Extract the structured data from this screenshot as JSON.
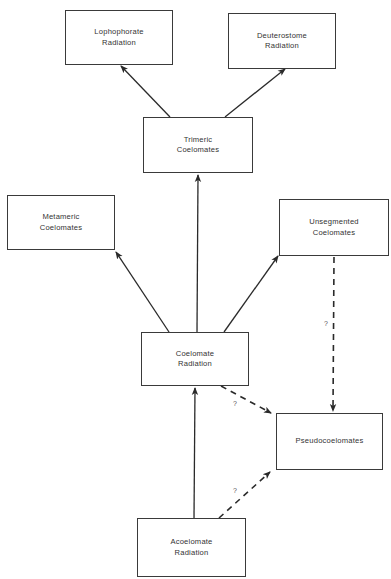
{
  "diagram": {
    "type": "phylogenetic-flow",
    "nodes": [
      {
        "id": "lophophorate",
        "label": "Lophophorate\nRadiation"
      },
      {
        "id": "deuterostome",
        "label": "Deuterostome\nRadiation"
      },
      {
        "id": "trimeric",
        "label": "Trimeric\nCoelomates"
      },
      {
        "id": "metameric",
        "label": "Metameric\nCoelomates"
      },
      {
        "id": "unsegmented",
        "label": "Unsegmented\nCoelomates"
      },
      {
        "id": "coelomate",
        "label": "Coelomate\nRadiation"
      },
      {
        "id": "pseudo",
        "label": "Pseudocoelomates"
      },
      {
        "id": "acoelomate",
        "label": "Acoelomate\nRadiation"
      }
    ],
    "edges": [
      {
        "from": "trimeric",
        "to": "lophophorate",
        "style": "solid",
        "label": ""
      },
      {
        "from": "trimeric",
        "to": "deuterostome",
        "style": "solid",
        "label": ""
      },
      {
        "from": "coelomate",
        "to": "trimeric",
        "style": "solid",
        "label": ""
      },
      {
        "from": "coelomate",
        "to": "metameric",
        "style": "solid",
        "label": ""
      },
      {
        "from": "coelomate",
        "to": "unsegmented",
        "style": "solid",
        "label": ""
      },
      {
        "from": "acoelomate",
        "to": "coelomate",
        "style": "solid",
        "label": ""
      },
      {
        "from": "coelomate",
        "to": "pseudo",
        "style": "dashed",
        "label": "?"
      },
      {
        "from": "acoelomate",
        "to": "pseudo",
        "style": "dashed",
        "label": "?"
      },
      {
        "from": "unsegmented",
        "to": "pseudo",
        "style": "dashed",
        "label": "?"
      }
    ],
    "uncertain_label": "?",
    "line_color": "#2a2a2a"
  }
}
